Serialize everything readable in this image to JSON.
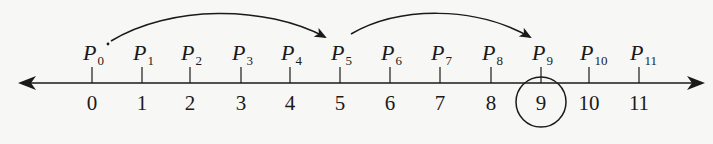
{
  "diagram": {
    "type": "number-line",
    "colors": {
      "ink": "#1a1a1a",
      "background": "#f7f7f5"
    },
    "axis": {
      "y": 83,
      "x_start": 20,
      "x_end": 703,
      "arrows": [
        "left",
        "right"
      ]
    },
    "ticks": [
      {
        "value": "0",
        "x": 92,
        "point": "P",
        "sub": "0"
      },
      {
        "value": "1",
        "x": 142,
        "point": "P",
        "sub": "1"
      },
      {
        "value": "2",
        "x": 190,
        "point": "P",
        "sub": "2"
      },
      {
        "value": "3",
        "x": 241,
        "point": "P",
        "sub": "3"
      },
      {
        "value": "4",
        "x": 290,
        "point": "P",
        "sub": "4"
      },
      {
        "value": "5",
        "x": 340,
        "point": "P",
        "sub": "5"
      },
      {
        "value": "6",
        "x": 390,
        "point": "P",
        "sub": "6"
      },
      {
        "value": "7",
        "x": 440,
        "point": "P",
        "sub": "7"
      },
      {
        "value": "8",
        "x": 491,
        "point": "P",
        "sub": "8"
      },
      {
        "value": "9",
        "x": 541,
        "point": "P",
        "sub": "9"
      },
      {
        "value": "10",
        "x": 589,
        "point": "P",
        "sub": "10"
      },
      {
        "value": "11",
        "x": 639,
        "point": "P",
        "sub": "11"
      }
    ],
    "jumps": [
      {
        "from": "P0",
        "to": "P5",
        "step": 5
      },
      {
        "from": "P5",
        "to": "P9",
        "step": 4
      }
    ],
    "highlight": {
      "value": "9",
      "shape": "circle"
    },
    "marker_dot": {
      "near": "P0"
    }
  }
}
